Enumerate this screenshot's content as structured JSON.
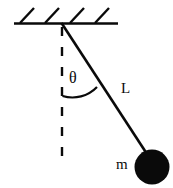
{
  "diagram": {
    "background_color": "#ffffff",
    "ink_color": "#0a0a0a",
    "width": 173,
    "height": 188,
    "labels": {
      "angle": "θ",
      "length": "L",
      "mass": "m"
    },
    "parts": {
      "ceiling_name": "ceiling-support",
      "hatching_name": "ceiling-hatching",
      "pivot_name": "pivot-point",
      "string_name": "pendulum-string",
      "vertical_name": "vertical-reference-dashed-line",
      "arc_name": "angle-arc",
      "bob_name": "pendulum-bob"
    },
    "geometry": {
      "ceiling_y": 23,
      "ceiling_x_start": 14,
      "ceiling_x_end": 118,
      "pivot": [
        62,
        23
      ],
      "bob_center": [
        152,
        167
      ],
      "bob_radius": 17,
      "vertical_line_end": [
        62,
        166
      ],
      "hatch_count": 4
    }
  }
}
